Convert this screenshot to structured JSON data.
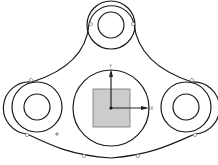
{
  "diagram": {
    "type": "cad-sketch",
    "axes": {
      "x_label": "X",
      "y_label": "Y"
    },
    "colors": {
      "line": "#1a1a1a",
      "fill": "#cccccc",
      "point": "#8a8a8a"
    },
    "center_circle": {
      "cx": 111,
      "cy": 108,
      "r": 38
    },
    "center_square": {
      "x": 93,
      "y": 89,
      "w": 37,
      "h": 38
    },
    "bosses": [
      {
        "name": "top",
        "cx": 111,
        "cy": 25,
        "r_outer": 24,
        "r_inner": 13
      },
      {
        "name": "left",
        "cx": 37,
        "cy": 107,
        "r_outer": 25,
        "r_inner": 13
      },
      {
        "name": "right",
        "cx": 186,
        "cy": 107,
        "r_outer": 25,
        "r_inner": 13
      }
    ]
  }
}
